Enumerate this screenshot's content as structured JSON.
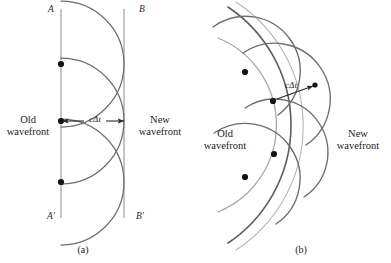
{
  "figure": {
    "caption_a": "(a)",
    "caption_b": "(b)",
    "colors": {
      "old_wavefront_line": "#9a9a9a",
      "new_wavefront_line": "#6b6b6b",
      "wavelet": "#7a7a7a",
      "source_dot": "#151515",
      "arrow": "#2a2a2a",
      "text": "#1b1b1b",
      "background": "#ffffff"
    }
  },
  "panel_a": {
    "label": "(a)",
    "line_top_label": "A",
    "line_top_right_label": "B",
    "line_bottom_label": "A′",
    "line_bottom_right_label": "B′",
    "old_wavefront_label_line1": "Old",
    "old_wavefront_label_line2": "wavefront",
    "new_wavefront_label_line1": "New",
    "new_wavefront_label_line2": "wavefront",
    "distance_label": "cΔt",
    "source_points": 3,
    "geometry": {
      "old_front_x": 61,
      "new_front_x": 124,
      "radius": 63,
      "dot_y": [
        64,
        121,
        182
      ]
    }
  },
  "panel_b": {
    "label": "(b)",
    "old_wavefront_label_line1": "Old",
    "old_wavefront_label_line2": "wavefront",
    "new_wavefront_label_line1": "New",
    "new_wavefront_label_line2": "wavefront",
    "distance_label": "cΔt",
    "source_points": 4,
    "geometry": {
      "center_x": 182,
      "center_y": 125,
      "old_radius": 94,
      "new_radius": 142,
      "wavelet_radius": 48,
      "dots": [
        [
          245,
          72
        ],
        [
          273,
          101
        ],
        [
          274,
          154
        ],
        [
          245,
          177
        ]
      ]
    }
  }
}
